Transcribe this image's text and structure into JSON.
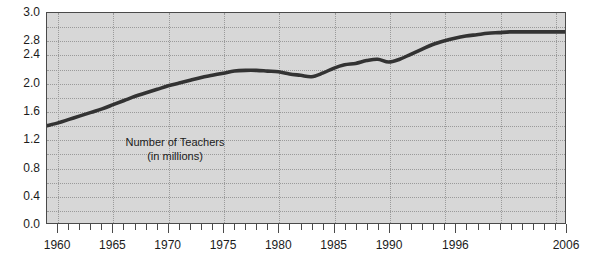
{
  "chart_data": {
    "type": "line",
    "title": "",
    "subtitle": "",
    "xlabel": "",
    "ylabel": "",
    "annotation_line1": "Number of Teachers",
    "annotation_line2": "(in millions)",
    "xlim": [
      1959,
      2006
    ],
    "ylim": [
      0.0,
      3.0
    ],
    "grid": true,
    "grid_style": "dotted",
    "legend": "none",
    "y_ticks": [
      0.0,
      0.4,
      0.8,
      1.2,
      1.6,
      2.0,
      2.4,
      2.8,
      3.0
    ],
    "y_tick_labels": [
      "0.0",
      "0.4",
      "0.8",
      "1.2",
      "1.6",
      "2.0",
      "2.4",
      "2.8",
      "3.0"
    ],
    "y_minor_grid_interval": 0.2,
    "x_tick_labels": [
      "1960",
      "1965",
      "1970",
      "1975",
      "1980",
      "1985",
      "1990",
      "1996",
      "2006"
    ],
    "x_label_positions": [
      1960,
      1965,
      1970,
      1975,
      1980,
      1985,
      1990,
      1996,
      2006
    ],
    "x_minor_tick_interval": 1,
    "series": [
      {
        "name": "Number of Teachers (in millions)",
        "color": "#333333",
        "x": [
          1959,
          1960,
          1961,
          1962,
          1963,
          1964,
          1965,
          1966,
          1967,
          1968,
          1969,
          1970,
          1971,
          1972,
          1973,
          1974,
          1975,
          1976,
          1977,
          1978,
          1979,
          1980,
          1981,
          1982,
          1983,
          1984,
          1985,
          1986,
          1987,
          1988,
          1989,
          1990,
          1991,
          1992,
          1993,
          1994,
          1995,
          1996,
          1997,
          1998,
          1999,
          2000,
          2001,
          2002,
          2003,
          2004,
          2005,
          2006
        ],
        "y": [
          1.39,
          1.43,
          1.48,
          1.53,
          1.58,
          1.63,
          1.69,
          1.75,
          1.81,
          1.86,
          1.91,
          1.96,
          2.0,
          2.04,
          2.08,
          2.11,
          2.14,
          2.17,
          2.18,
          2.18,
          2.17,
          2.16,
          2.13,
          2.11,
          2.09,
          2.14,
          2.21,
          2.26,
          2.28,
          2.32,
          2.34,
          2.3,
          2.34,
          2.41,
          2.48,
          2.55,
          2.6,
          2.64,
          2.67,
          2.69,
          2.71,
          2.72,
          2.73,
          2.73,
          2.73,
          2.73,
          2.73,
          2.73
        ]
      }
    ],
    "colors": {
      "plot_background": "#d7d7d7",
      "plot_border": "#4a4a4a",
      "gridline": "#9a9a9a",
      "line": "#333333",
      "text": "#1b1b1b",
      "page_background": "#ffffff"
    }
  }
}
